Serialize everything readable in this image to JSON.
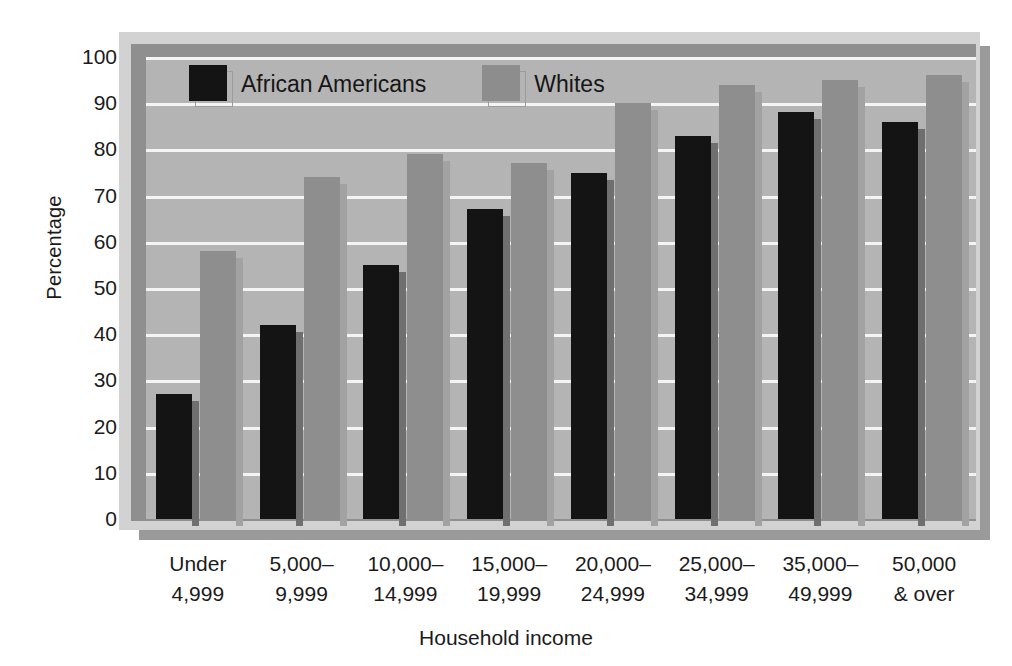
{
  "chart_data": {
    "type": "bar",
    "title": "",
    "xlabel": "Household income",
    "ylabel": "Percentage",
    "ylim": [
      0,
      100
    ],
    "ytick_step": 10,
    "yticks": [
      100,
      90,
      80,
      70,
      60,
      50,
      40,
      30,
      20,
      10,
      0
    ],
    "grid": true,
    "legend_position": "top-left-inside",
    "categories": [
      "Under\n4,999",
      "5,000–\n9,999",
      "10,000–\n14,999",
      "15,000–\n19,999",
      "20,000–\n24,999",
      "25,000–\n34,999",
      "35,000–\n49,999",
      "50,000\n& over"
    ],
    "category_lines": [
      [
        "Under",
        "4,999"
      ],
      [
        "5,000–",
        "9,999"
      ],
      [
        "10,000–",
        "14,999"
      ],
      [
        "15,000–",
        "19,999"
      ],
      [
        "20,000–",
        "24,999"
      ],
      [
        "25,000–",
        "34,999"
      ],
      [
        "35,000–",
        "49,999"
      ],
      [
        "50,000",
        "& over"
      ]
    ],
    "series": [
      {
        "name": "African Americans",
        "color": "#141414",
        "values": [
          27,
          42,
          55,
          67,
          75,
          83,
          88,
          86
        ]
      },
      {
        "name": "Whites",
        "color": "#8e8e8e",
        "values": [
          58,
          74,
          79,
          77,
          90,
          94,
          95,
          96
        ]
      }
    ]
  },
  "legend": {
    "items": [
      {
        "label": "African Americans",
        "swatch": "black"
      },
      {
        "label": "Whites",
        "swatch": "white"
      }
    ]
  },
  "axes": {
    "y_title": "Percentage",
    "x_title": "Household income"
  },
  "colors": {
    "background": "#ffffff",
    "plot_area": "#b4b4b4",
    "frame_mat": "#d2d2d2",
    "frame_bevel": "#8f8f8f",
    "frame_shadow": "#9a9a9a",
    "gridline": "#f4f4f4",
    "series_black": "#141414",
    "series_white": "#8e8e8e",
    "text": "#1b1b1b"
  }
}
